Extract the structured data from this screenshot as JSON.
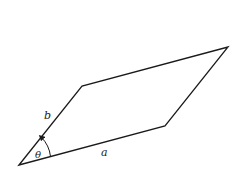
{
  "diagram": {
    "type": "parallelogram",
    "stroke_color": "#1a1a1a",
    "vertices": {
      "bottom_left": [
        19,
        165
      ],
      "top_left": [
        82,
        86
      ],
      "top_right": [
        228,
        47
      ],
      "bottom_right": [
        165,
        126
      ]
    },
    "labels": {
      "side_a": "a",
      "side_b": "b",
      "angle": "θ"
    }
  }
}
